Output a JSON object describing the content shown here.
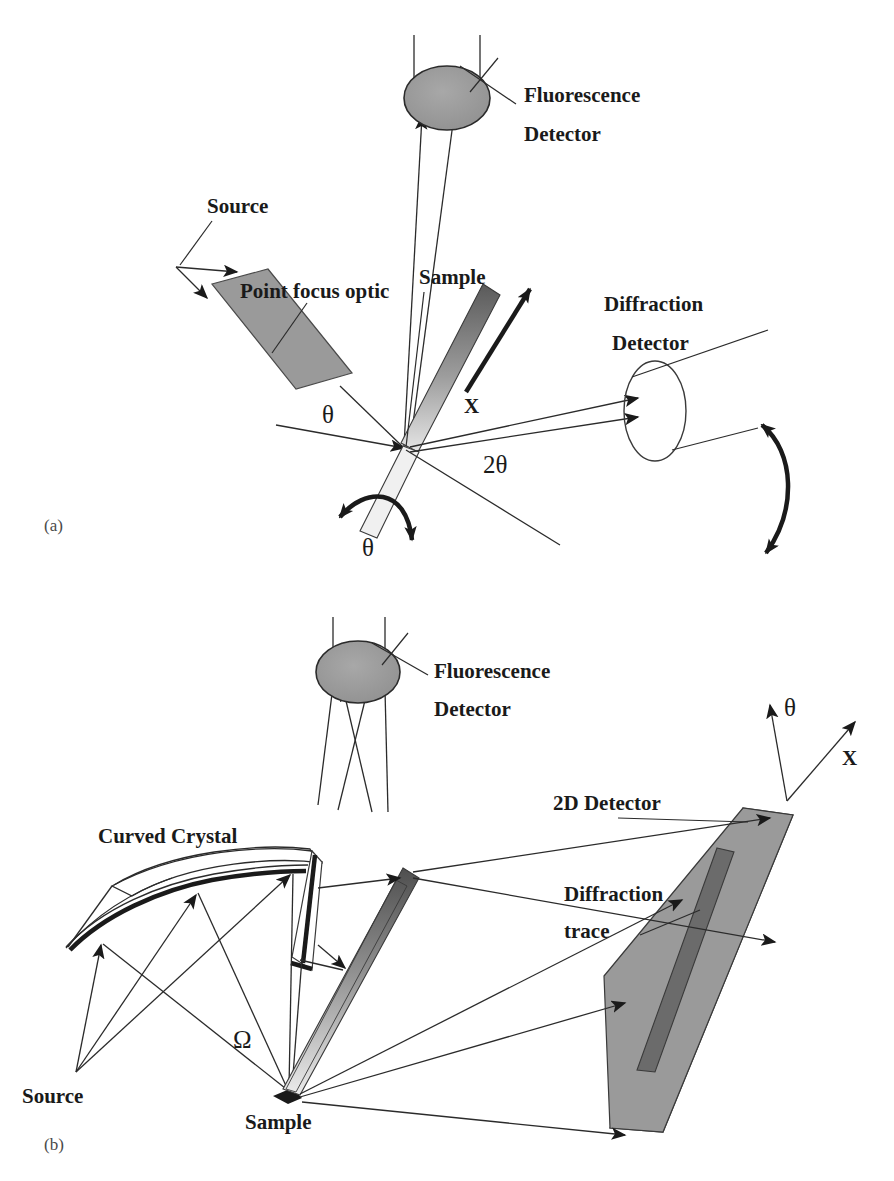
{
  "figure": {
    "background_color": "#ffffff",
    "ink_color": "#1a1a1a",
    "gray_fill": "#9a9a9a",
    "dark_fill": "#6b6b6b",
    "panels": [
      {
        "id": "a",
        "caption": "(a)"
      },
      {
        "id": "b",
        "caption": "(b)"
      }
    ]
  },
  "panel_a": {
    "caption": "(a)",
    "labels": {
      "fluorescence_detector_line1": "Fluorescence",
      "fluorescence_detector_line2": "Detector",
      "source": "Source",
      "point_focus_optic": "Point focus optic",
      "sample": "Sample",
      "diffraction_detector_line1": "Diffraction",
      "diffraction_detector_line2": "Detector",
      "axis_x": "X",
      "angle_theta_incident": "θ",
      "angle_two_theta": "2θ",
      "angle_theta_rotation": "θ"
    },
    "components": [
      {
        "name": "fluorescence-detector",
        "shape": "filled-ellipse",
        "fill": "#9a9a9a"
      },
      {
        "name": "point-focus-optic",
        "shape": "gray-parallelogram",
        "fill": "#9a9a9a"
      },
      {
        "name": "sample",
        "shape": "gradient-bar",
        "fill": "gradient dark-to-light"
      },
      {
        "name": "diffraction-detector",
        "shape": "open-ellipse",
        "fill": "none"
      },
      {
        "name": "theta-rotation-arc",
        "shape": "curved-double-arrow"
      },
      {
        "name": "two-theta-rotation-arc",
        "shape": "curved-double-arrow"
      }
    ]
  },
  "panel_b": {
    "caption": "(b)",
    "labels": {
      "fluorescence_detector_line1": "Fluorescence",
      "fluorescence_detector_line2": "Detector",
      "curved_crystal": "Curved Crystal",
      "source": "Source",
      "sample": "Sample",
      "two_d_detector": "2D Detector",
      "diffraction_trace_line1": "Diffraction",
      "diffraction_trace_line2": "trace",
      "axis_theta": "θ",
      "axis_x": "X",
      "angle_omega": "Ω"
    },
    "components": [
      {
        "name": "fluorescence-detector",
        "shape": "filled-ellipse",
        "fill": "#9a9a9a"
      },
      {
        "name": "curved-crystal",
        "shape": "curved-surface",
        "fill": "none",
        "edge": "#1a1a1a"
      },
      {
        "name": "sample",
        "shape": "gradient-bar",
        "fill": "gradient dark-to-light"
      },
      {
        "name": "two-d-detector",
        "shape": "gray-parallelogram",
        "fill": "#9a9a9a"
      },
      {
        "name": "diffraction-trace",
        "shape": "dark-bar",
        "fill": "#6b6b6b"
      }
    ]
  }
}
